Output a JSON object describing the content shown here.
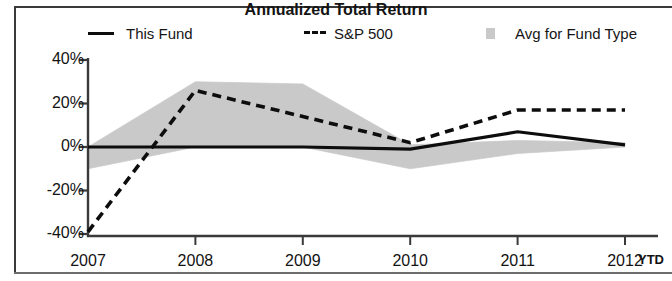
{
  "chart_data": {
    "type": "line",
    "title": "Annualized Total Return",
    "xlabel": "",
    "ylabel": "",
    "x": [
      "2007",
      "2008",
      "2009",
      "2010",
      "2011",
      "2012"
    ],
    "x_extra_label": "YTD",
    "ylim": [
      -40,
      40
    ],
    "yticks": [
      40,
      20,
      0,
      -20,
      -40
    ],
    "ytick_labels": [
      "40%",
      "20%",
      "0%",
      "-20%",
      "-40%"
    ],
    "grid": false,
    "legend_position": "top",
    "series": [
      {
        "name": "This Fund",
        "style": "solid",
        "color": "#0d0d0d",
        "values": [
          0,
          0,
          0,
          -1,
          7,
          1
        ]
      },
      {
        "name": "S&P 500",
        "style": "dashed",
        "color": "#0d0d0d",
        "values": [
          -39,
          26,
          14,
          2,
          17,
          17
        ]
      },
      {
        "name": "Avg for Fund Type",
        "style": "band",
        "color": "#c9c9c9",
        "band_upper": [
          0,
          30,
          29,
          1,
          3,
          2
        ],
        "band_lower": [
          -10,
          0,
          0,
          -10,
          -3,
          0
        ]
      }
    ]
  },
  "legend": {
    "items": [
      {
        "label": "This Fund",
        "marker": "solid-line-swatch"
      },
      {
        "label": "S&P 500",
        "marker": "dashed-line-swatch"
      },
      {
        "label": "Avg for Fund Type",
        "marker": "shaded-band-swatch"
      }
    ]
  },
  "axes": {
    "y_tick_labels": [
      "40%",
      "20%",
      "0%",
      "-20%",
      "-40%"
    ],
    "x_tick_labels": [
      "2007",
      "2008",
      "2009",
      "2010",
      "2011",
      "2012"
    ],
    "x_suffix_label": "YTD"
  },
  "colors": {
    "line": "#0d0d0d",
    "band": "#c9c9c9",
    "axis": "#3a3a3a",
    "text": "#131313",
    "background": "#ffffff"
  }
}
